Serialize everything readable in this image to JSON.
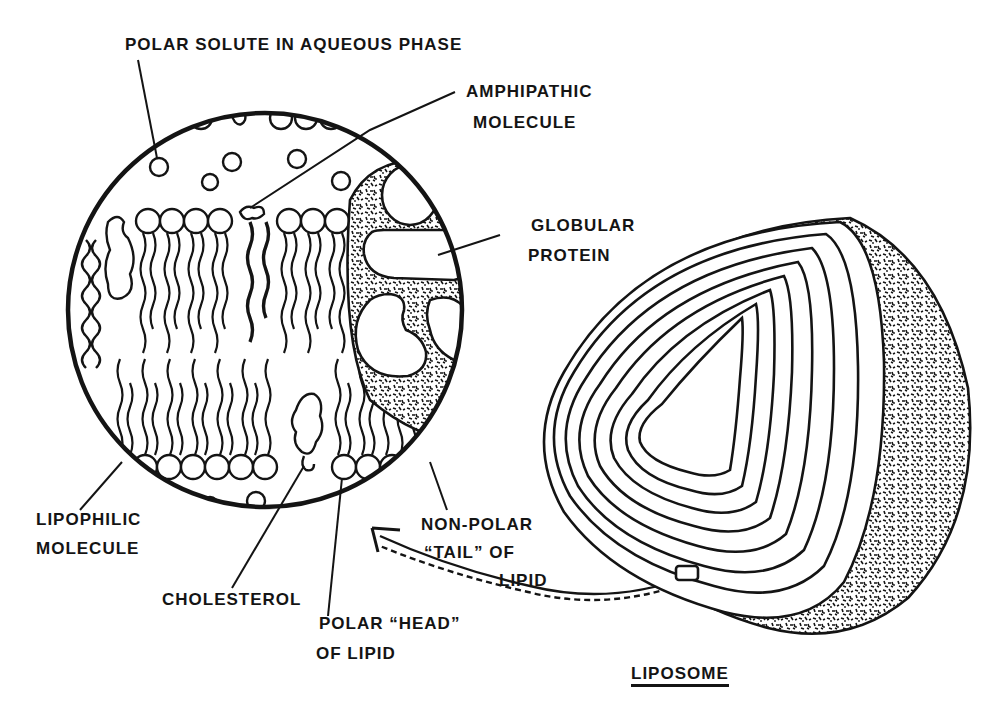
{
  "figure": {
    "title": "LIPOSOME",
    "ink_color": "#141414",
    "background": "#ffffff"
  },
  "labels": {
    "polar_solute": {
      "line1": "POLAR SOLUTE IN AQUEOUS PHASE"
    },
    "amphipathic": {
      "line1": "AMPHIPATHIC",
      "line2": "MOLECULE"
    },
    "globular_protein": {
      "line1": "GLOBULAR",
      "line2": "PROTEIN"
    },
    "lipophilic": {
      "line1": "LIPOPHILIC",
      "line2": "MOLECULE"
    },
    "cholesterol": {
      "line1": "CHOLESTEROL"
    },
    "polar_head": {
      "line1": "POLAR “HEAD”",
      "line2": "OF LIPID"
    },
    "nonpolar_tail": {
      "line1": "NON-POLAR",
      "line2": "“TAIL” OF",
      "line3": "LIPID"
    },
    "liposome": {
      "line1": "LIPOSOME"
    }
  },
  "components": {
    "magnified_view": "bilayer-membrane-circle",
    "liposome_body": "concentric-lamellae",
    "arrow": "magnification-arrow"
  }
}
